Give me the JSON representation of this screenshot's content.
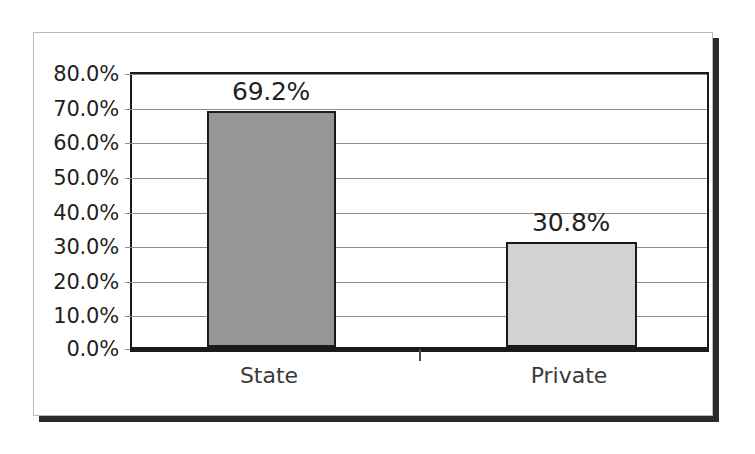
{
  "chart_data": {
    "type": "bar",
    "title": "",
    "subtitle": "",
    "xlabel": "",
    "ylabel": "",
    "categories": [
      "State",
      "Private"
    ],
    "values": [
      69.2,
      30.8
    ],
    "value_labels": [
      "69.2%",
      "30.8%"
    ],
    "ylim": [
      0,
      80
    ],
    "ytick_step": 10,
    "ytick_labels": [
      "0.0%",
      "10.0%",
      "20.0%",
      "30.0%",
      "40.0%",
      "50.0%",
      "60.0%",
      "70.0%",
      "80.0%"
    ],
    "grid": true,
    "legend": false,
    "legend_position": "none",
    "series": [
      {
        "name": "",
        "values": [
          69.2,
          30.8
        ],
        "bar_colors": [
          "#969696",
          "#d2d2d2"
        ],
        "bar_border_color": "#1a1a1a"
      }
    ],
    "colors": {
      "bar_state": "#969696",
      "bar_private": "#d2d2d2",
      "axis": "#1a1a1a",
      "gridline": "#8d8d8d",
      "text": "#231f20",
      "frame_border": "#b9b9b9",
      "frame_shadow": "#2b2b2b",
      "background": "#ffffff"
    }
  }
}
